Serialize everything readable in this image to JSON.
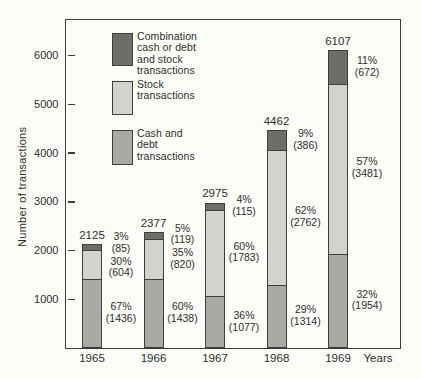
{
  "colors": {
    "background": "#fcfcf9",
    "axis": "#3e3e3c",
    "text": "#2f2f2d",
    "combination": "#6d6d6a",
    "stock": "#d2d2cf",
    "cash": "#a9a9a5"
  },
  "legend": {
    "items": [
      {
        "key": "combination",
        "lines": [
          "Combination",
          "cash or debt",
          "and stock",
          "transactions"
        ]
      },
      {
        "key": "stock",
        "lines": [
          "Stock",
          "transactions"
        ]
      },
      {
        "key": "cash",
        "lines": [
          "Cash and",
          "debt",
          "transactions"
        ]
      }
    ]
  },
  "chart_data": {
    "type": "bar",
    "stacked": true,
    "title": "",
    "xlabel": "Years",
    "ylabel": "Number of transactions",
    "ylim": [
      0,
      6750
    ],
    "yticks": [
      1000,
      2000,
      3000,
      4000,
      5000,
      6000
    ],
    "grid": false,
    "legend_position": "upper-left-inside",
    "categories": [
      "1965",
      "1966",
      "1967",
      "1968",
      "1969"
    ],
    "totals": [
      2125,
      2377,
      2975,
      4462,
      6107
    ],
    "series": [
      {
        "name": "Cash and debt transactions",
        "key": "cash",
        "values": [
          1436,
          1438,
          1077,
          1314,
          1954
        ],
        "percent_labels": [
          "67%",
          "60%",
          "36%",
          "29%",
          "32%"
        ]
      },
      {
        "name": "Stock transactions",
        "key": "stock",
        "values": [
          604,
          820,
          1783,
          2762,
          3481
        ],
        "percent_labels": [
          "30%",
          "35%",
          "60%",
          "62%",
          "57%"
        ]
      },
      {
        "name": "Combination cash or debt and stock transactions",
        "key": "combination",
        "values": [
          85,
          119,
          115,
          386,
          672
        ],
        "percent_labels": [
          "3%",
          "5%",
          "4%",
          "9%",
          "11%"
        ]
      }
    ]
  }
}
